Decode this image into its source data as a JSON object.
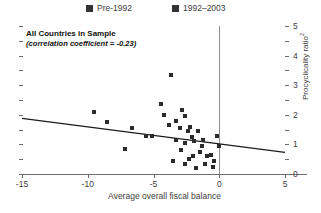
{
  "legend": {
    "position": "top-center",
    "items": [
      {
        "label": "Pre-1992",
        "marker": "filled-square",
        "color": "#333333"
      },
      {
        "label": "1992–2003",
        "marker": "filled-square",
        "color": "#333333"
      }
    ]
  },
  "annotations": {
    "title": "All Countries in Sample",
    "subtitle": "(correlation coefficient = -0.23)"
  },
  "axes": {
    "x": {
      "label": "Average overall fiscal balance",
      "ticks": [
        "-15",
        "-10",
        "-5",
        "0",
        "5"
      ],
      "tick_values": [
        -15,
        -10,
        -5,
        0,
        5
      ],
      "min": -15,
      "max": 5
    },
    "y": {
      "label": "Procyclicality ratio",
      "label_superscript": "2",
      "ticks": [
        "0",
        "1",
        "2",
        "3",
        "4",
        "5"
      ],
      "tick_values": [
        0,
        1,
        2,
        3,
        4,
        5
      ],
      "minor_tick_values": [
        0.5,
        1.5,
        2.5,
        3.5,
        4.5
      ],
      "min": 0,
      "max": 5,
      "side": "right"
    }
  },
  "reference_line": {
    "orientation": "vertical",
    "x": 0,
    "color": "#8f8f8f"
  },
  "chart_data": {
    "type": "scatter",
    "title": "All Countries in Sample",
    "subtitle": "(correlation coefficient = -0.23)",
    "xlabel": "Average overall fiscal balance",
    "ylabel": "Procyclicality ratio 2",
    "xlim": [
      -15,
      5
    ],
    "ylim": [
      0,
      5
    ],
    "grid": false,
    "legend_position": "top-center",
    "correlation_coefficient": -0.23,
    "marker": "filled-square",
    "marker_color": "#2b2b2b",
    "series": [
      {
        "name": "Pre-1992",
        "points": [
          [
            -3.7,
            3.35
          ],
          [
            -9.5,
            2.1
          ],
          [
            -8.5,
            1.75
          ],
          [
            -6.6,
            1.55
          ],
          [
            -5.1,
            1.3
          ],
          [
            -5.6,
            1.3
          ],
          [
            -7.2,
            0.85
          ],
          [
            -4.4,
            2.35
          ],
          [
            -3.3,
            1.8
          ],
          [
            -2.6,
            1.95
          ],
          [
            -3.0,
            1.55
          ],
          [
            -2.2,
            1.6
          ],
          [
            -2.4,
            1.45
          ],
          [
            -1.6,
            1.45
          ],
          [
            -3.3,
            1.15
          ],
          [
            -2.6,
            1.05
          ],
          [
            -1.9,
            1.1
          ],
          [
            -1.2,
            1.15
          ],
          [
            -2.9,
            0.8
          ],
          [
            -1.5,
            0.75
          ],
          [
            -2.0,
            0.6
          ],
          [
            -2.3,
            0.5
          ],
          [
            -0.9,
            0.6
          ],
          [
            -0.6,
            0.65
          ],
          [
            -0.4,
            0.45
          ],
          [
            -1.1,
            0.35
          ],
          [
            -0.2,
            1.3
          ],
          [
            -0.05,
            0.95
          ]
        ]
      },
      {
        "name": "1992–2003",
        "points": [
          [
            -4.2,
            2.0
          ],
          [
            -2.8,
            2.15
          ],
          [
            -3.8,
            1.65
          ],
          [
            -2.1,
            1.25
          ],
          [
            -1.3,
            0.95
          ],
          [
            -2.6,
            0.35
          ],
          [
            -0.5,
            0.25
          ],
          [
            -3.5,
            0.45
          ],
          [
            -1.8,
            0.2
          ]
        ]
      }
    ],
    "trend_line": {
      "x_start": -15,
      "y_start": 1.88,
      "x_end": 5,
      "y_end": 0.73
    }
  }
}
